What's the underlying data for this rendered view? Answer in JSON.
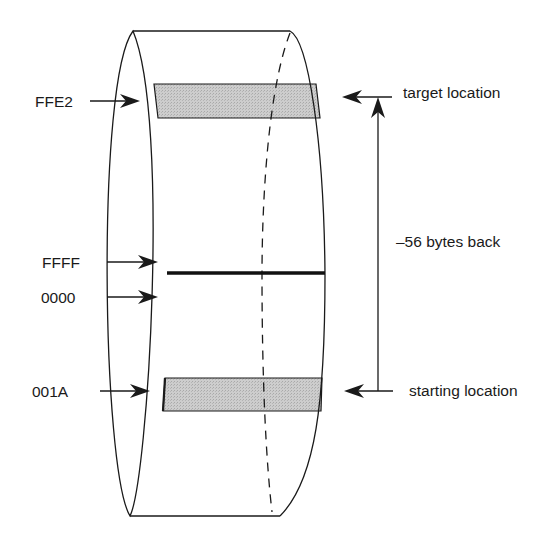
{
  "diagram": {
    "left_labels": [
      {
        "id": "ffe2",
        "text": "FFE2"
      },
      {
        "id": "ffff",
        "text": "FFFF"
      },
      {
        "id": "0000",
        "text": "0000"
      },
      {
        "id": "001a",
        "text": "001A"
      }
    ],
    "right_labels": {
      "target": "target location",
      "offset": "–56 bytes back",
      "start": "starting location"
    },
    "colors": {
      "stroke": "#1a1a1a",
      "band_fill": "#c4c4c4",
      "background": "#ffffff"
    }
  }
}
